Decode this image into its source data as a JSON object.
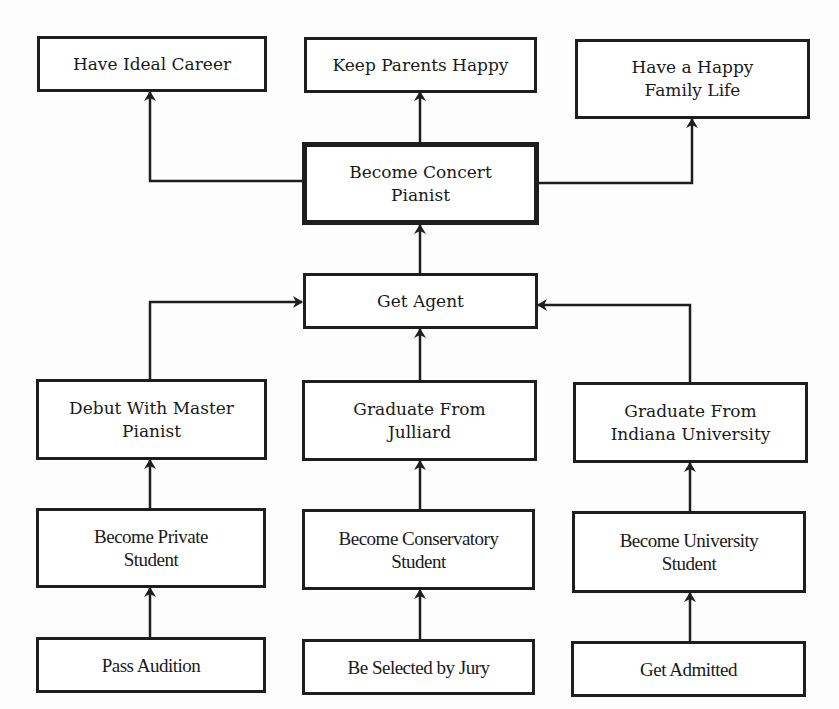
{
  "diagram": {
    "type": "goal-hierarchy",
    "central_goal": "Become Concert Pianist",
    "nodes": {
      "have_ideal_career": {
        "label": "Have Ideal Career"
      },
      "keep_parents_happy": {
        "label": "Keep Parents Happy"
      },
      "happy_family_life": {
        "line1": "Have a Happy",
        "line2": "Family Life"
      },
      "concert_pianist": {
        "line1": "Become Concert",
        "line2": "Pianist"
      },
      "get_agent": {
        "label": "Get Agent"
      },
      "debut_master": {
        "line1": "Debut With Master",
        "line2": "Pianist"
      },
      "grad_julliard": {
        "line1": "Graduate From",
        "line2": "Julliard"
      },
      "grad_indiana": {
        "line1": "Graduate From",
        "line2": "Indiana University"
      },
      "private_student": {
        "line1": "Become Private",
        "line2": "Student"
      },
      "conservatory_student": {
        "line1": "Become Conservatory",
        "line2": "Student"
      },
      "university_student": {
        "line1": "Become University",
        "line2": "Student"
      },
      "pass_audition": {
        "label": "Pass Audition"
      },
      "selected_by_jury": {
        "label": "Be Selected by Jury"
      },
      "get_admitted": {
        "label": "Get Admitted"
      }
    },
    "edges": [
      [
        "concert_pianist",
        "have_ideal_career"
      ],
      [
        "concert_pianist",
        "keep_parents_happy"
      ],
      [
        "concert_pianist",
        "happy_family_life"
      ],
      [
        "get_agent",
        "concert_pianist"
      ],
      [
        "debut_master",
        "get_agent"
      ],
      [
        "grad_julliard",
        "get_agent"
      ],
      [
        "grad_indiana",
        "get_agent"
      ],
      [
        "private_student",
        "debut_master"
      ],
      [
        "conservatory_student",
        "grad_julliard"
      ],
      [
        "university_student",
        "grad_indiana"
      ],
      [
        "pass_audition",
        "private_student"
      ],
      [
        "selected_by_jury",
        "conservatory_student"
      ],
      [
        "get_admitted",
        "university_student"
      ]
    ],
    "colors": {
      "stroke": "#1e1e1e",
      "background": "#ffffff"
    }
  }
}
